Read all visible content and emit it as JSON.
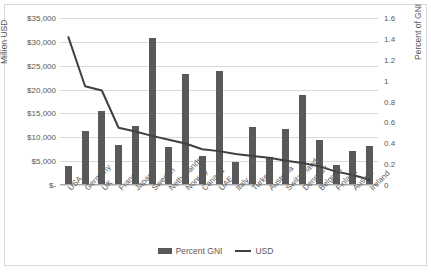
{
  "chart_data": {
    "type": "bar",
    "title": "",
    "subtitle": "",
    "xlabel": "",
    "ylabel": "Million USD",
    "y2label": "Percent of GNI",
    "grid": true,
    "legend_position": "bottom",
    "categories": [
      "USA",
      "Germany",
      "UK",
      "France",
      "Japan",
      "Sweden",
      "Netherlands",
      "Norway",
      "Canada",
      "UAE",
      "Italy",
      "Turkey",
      "Australia",
      "Switzerland",
      "Denmark",
      "Belgium",
      "Finland",
      "Austria",
      "Ireland"
    ],
    "ylim": [
      0,
      35000
    ],
    "yticks": [
      0,
      5000,
      10000,
      15000,
      20000,
      25000,
      30000,
      35000
    ],
    "ytick_labels": [
      "$-",
      "$5,000",
      "$10,000",
      "$15,000",
      "$20,000",
      "$25,000",
      "$30,000",
      "$35,000"
    ],
    "y2lim": [
      0,
      1.6
    ],
    "y2ticks": [
      0,
      0.2,
      0.4,
      0.6,
      0.8,
      1,
      1.2,
      1.4,
      1.6
    ],
    "y2tick_labels": [
      "0",
      "0.2",
      "0.4",
      "0.6",
      "0.8",
      "1",
      "1.2",
      "1.4",
      "1.6"
    ],
    "series": [
      {
        "name": "Percent GNI",
        "type": "bar",
        "axis": "right",
        "color": "#595959",
        "values": [
          0.17,
          0.51,
          0.7,
          0.37,
          0.56,
          1.4,
          0.35,
          1.05,
          0.27,
          1.08,
          0.21,
          0.55,
          0.26,
          0.53,
          0.85,
          0.42,
          0.18,
          0.32,
          0.36
        ]
      },
      {
        "name": "USD",
        "type": "line",
        "axis": "left",
        "color": "#404040",
        "values": [
          31000,
          20700,
          19800,
          12000,
          11200,
          10300,
          9500,
          8700,
          7500,
          7100,
          6500,
          6100,
          5700,
          5100,
          4600,
          3900,
          2800,
          2100,
          1100
        ]
      }
    ],
    "legend": [
      {
        "label": "Percent GNI",
        "marker": "bar-swatch"
      },
      {
        "label": "USD",
        "marker": "line-swatch"
      }
    ]
  }
}
